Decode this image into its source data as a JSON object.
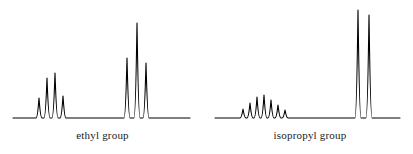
{
  "figure": {
    "background_color": "#ffffff",
    "trace_color": "#000000",
    "trace_width": 1.1
  },
  "captions": {
    "left": "ethyl group",
    "right": "isopropyl group"
  },
  "chart_data": [
    {
      "type": "line",
      "name": "ethyl-group-spectrum",
      "title": "ethyl group",
      "xlabel": "",
      "ylabel": "",
      "grid": false,
      "legend": "none",
      "axis_box": {
        "x0": 13,
        "x1": 190,
        "baseline_y": 118
      },
      "xlim": [
        13,
        190
      ],
      "ylim": [
        118,
        14
      ],
      "multiplets": [
        {
          "name": "quartet",
          "assignment": "CH2",
          "peak_count": 4,
          "intensity_ratio": [
            1,
            3,
            3,
            1
          ],
          "peaks": [
            {
              "x": 39,
              "height": 20
            },
            {
              "x": 47,
              "height": 40
            },
            {
              "x": 55,
              "height": 45
            },
            {
              "x": 63,
              "height": 22
            }
          ]
        },
        {
          "name": "triplet",
          "assignment": "CH3",
          "peak_count": 3,
          "intensity_ratio": [
            1,
            2,
            1
          ],
          "peaks": [
            {
              "x": 127,
              "height": 60
            },
            {
              "x": 137,
              "height": 95
            },
            {
              "x": 146,
              "height": 55
            }
          ]
        }
      ]
    },
    {
      "type": "line",
      "name": "isopropyl-group-spectrum",
      "title": "isopropyl group",
      "xlabel": "",
      "ylabel": "",
      "grid": false,
      "legend": "none",
      "axis_box": {
        "x0": 215,
        "x1": 400,
        "baseline_y": 118
      },
      "xlim": [
        215,
        400
      ],
      "ylim": [
        118,
        14
      ],
      "multiplets": [
        {
          "name": "septet",
          "assignment": "CH",
          "peak_count": 7,
          "intensity_ratio": [
            1,
            6,
            15,
            20,
            15,
            6,
            1
          ],
          "peaks": [
            {
              "x": 243,
              "height": 9
            },
            {
              "x": 250,
              "height": 15
            },
            {
              "x": 257,
              "height": 21
            },
            {
              "x": 264,
              "height": 23
            },
            {
              "x": 271,
              "height": 18
            },
            {
              "x": 278,
              "height": 13
            },
            {
              "x": 285,
              "height": 8
            }
          ]
        },
        {
          "name": "doublet",
          "assignment": "(CH3)2",
          "peak_count": 2,
          "intensity_ratio": [
            1,
            1
          ],
          "peaks": [
            {
              "x": 358,
              "height": 108
            },
            {
              "x": 369,
              "height": 103
            }
          ]
        }
      ]
    }
  ]
}
